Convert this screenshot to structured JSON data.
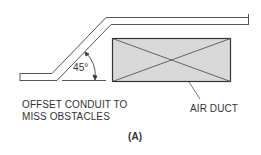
{
  "diagram": {
    "angle_label": "45°",
    "caption_line1": "OFFSET CONDUIT TO",
    "caption_line2": "MISS OBSTACLES",
    "duct_label": "AIR DUCT",
    "figure_label": "(A)",
    "colors": {
      "line": "#444444",
      "duct_fill": "#d9d9d9",
      "duct_border": "#333333"
    }
  }
}
